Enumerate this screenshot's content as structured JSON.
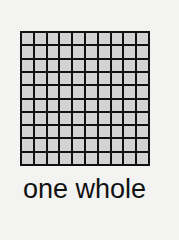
{
  "figure": {
    "grid": {
      "rows": 10,
      "columns": 10,
      "cell_color": "#d3d3d3",
      "line_color": "#111111",
      "shaded_cells": 100
    },
    "caption": "one whole"
  },
  "colors": {
    "background": "#f3f3f1",
    "cell": "#d3d3d3",
    "line": "#111111"
  }
}
